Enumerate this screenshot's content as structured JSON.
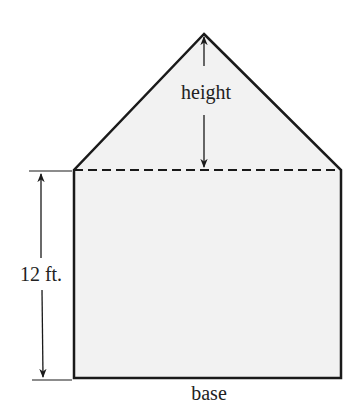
{
  "figure": {
    "labels": {
      "height": "height",
      "side": "12 ft.",
      "base": "base"
    },
    "colors": {
      "fill": "#f2f2f2",
      "stroke": "#1a1a1a"
    }
  }
}
